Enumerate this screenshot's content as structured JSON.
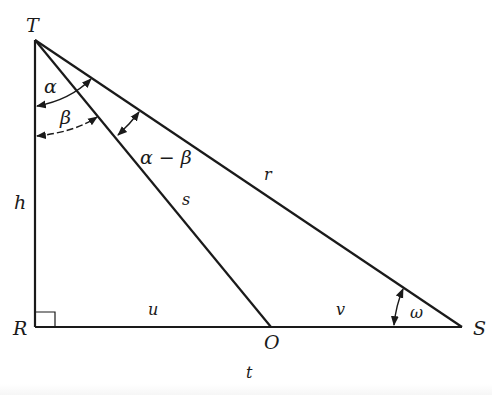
{
  "diagram": {
    "type": "right-triangle-geometry",
    "points": {
      "T": {
        "label": "T",
        "x": 35,
        "y": 40
      },
      "R": {
        "label": "R",
        "x": 35,
        "y": 327
      },
      "O": {
        "label": "O",
        "x": 271,
        "y": 327
      },
      "S": {
        "label": "S",
        "x": 462,
        "y": 327
      }
    },
    "segments": {
      "h": {
        "label": "h",
        "from": "T",
        "to": "R"
      },
      "s": {
        "label": "s",
        "from": "T",
        "to": "O"
      },
      "r": {
        "label": "r",
        "from": "T",
        "to": "S"
      },
      "u": {
        "label": "u",
        "from": "R",
        "to": "O"
      },
      "v": {
        "label": "v",
        "from": "O",
        "to": "S"
      },
      "t": {
        "label": "t",
        "from": "R",
        "to": "S"
      }
    },
    "angles": {
      "alpha": {
        "label": "α",
        "between": [
          "TR",
          "TS"
        ],
        "vertex": "T"
      },
      "beta": {
        "label": "β",
        "between": [
          "TR",
          "TO"
        ],
        "vertex": "T"
      },
      "alpha_minus_beta": {
        "label": "α − β",
        "between": [
          "TO",
          "TS"
        ],
        "vertex": "T"
      },
      "omega": {
        "label": "ω",
        "between": [
          "SR",
          "ST"
        ],
        "vertex": "S"
      },
      "right_angle": {
        "label": "",
        "vertex": "R"
      }
    },
    "colors": {
      "stroke": "#1a1a1a",
      "background": "#ffffff"
    }
  }
}
